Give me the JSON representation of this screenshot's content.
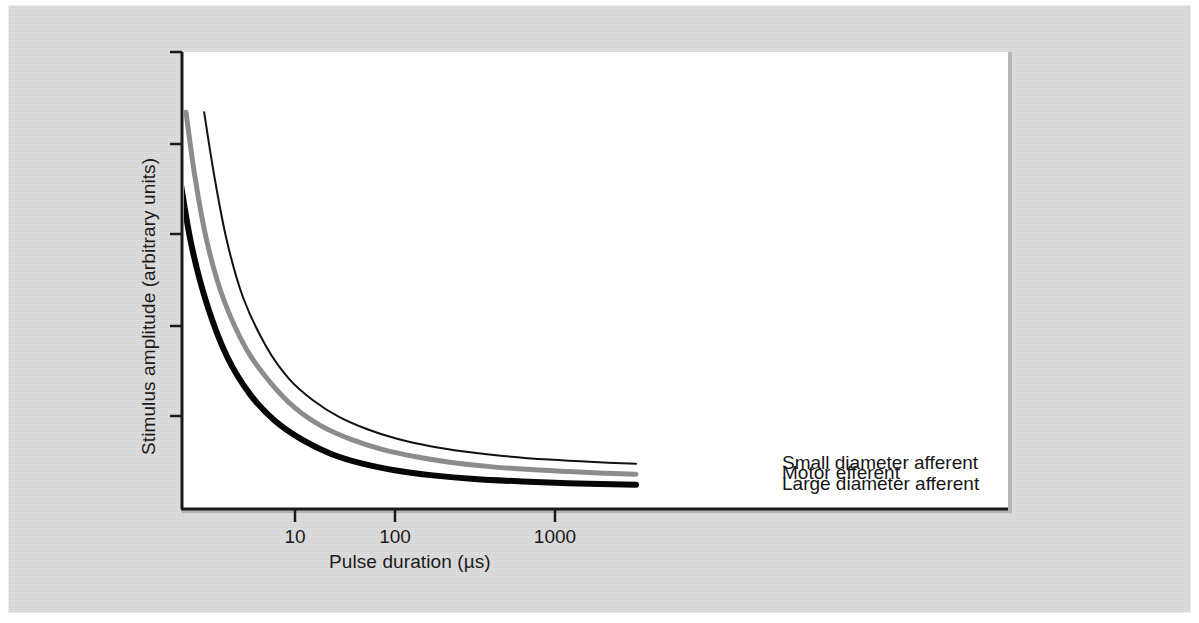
{
  "chart_data": {
    "type": "line",
    "title": "",
    "subtitle": "",
    "xlabel": "Pulse duration (µs)",
    "ylabel": "Stimulus amplitude (arbitrary units)",
    "xscale": "log",
    "yscale": "linear",
    "grid": false,
    "legend_position": "inline-right-of-curves",
    "xticks": [
      {
        "value": 10,
        "label": "10",
        "px": 295
      },
      {
        "value": 100,
        "label": "100",
        "px": 395
      },
      {
        "value": 1000,
        "label": "1000",
        "px": 555
      }
    ],
    "yticks": [
      {
        "label": "",
        "px": 52
      },
      {
        "label": "",
        "px": 144
      },
      {
        "label": "",
        "px": 234
      },
      {
        "label": "",
        "px": 326
      },
      {
        "label": "",
        "px": 416
      }
    ],
    "annotation": "Strength-duration curves: larger diameter fibres are recruited at lower stimulus amplitude for any given pulse duration.",
    "series": [
      {
        "name": "Small diameter afferent",
        "color": "#111111",
        "linewidth": 2,
        "style": "thin-black",
        "rheobase": 0.3,
        "chronaxie_us": 7.0,
        "points": [
          {
            "x": 2.0,
            "y": 0.96
          },
          {
            "x": 2.4,
            "y": 0.8
          },
          {
            "x": 3.0,
            "y": 0.64
          },
          {
            "x": 4.0,
            "y": 0.5
          },
          {
            "x": 6.0,
            "y": 0.38
          },
          {
            "x": 9.0,
            "y": 0.3
          },
          {
            "x": 14.0,
            "y": 0.245
          },
          {
            "x": 22.0,
            "y": 0.205
          },
          {
            "x": 36.0,
            "y": 0.175
          },
          {
            "x": 60.0,
            "y": 0.152
          },
          {
            "x": 110.0,
            "y": 0.133
          },
          {
            "x": 200.0,
            "y": 0.12
          },
          {
            "x": 400.0,
            "y": 0.109
          },
          {
            "x": 900.0,
            "y": 0.1
          },
          {
            "x": 2000.0,
            "y": 0.094
          },
          {
            "x": 4200.0,
            "y": 0.09
          }
        ]
      },
      {
        "name": "Motor efferent",
        "color": "#8c8c8c",
        "linewidth": 5,
        "style": "thick-gray",
        "rheobase": 0.22,
        "chronaxie_us": 4.5,
        "points": [
          {
            "x": 1.45,
            "y": 0.96
          },
          {
            "x": 1.7,
            "y": 0.8
          },
          {
            "x": 2.1,
            "y": 0.64
          },
          {
            "x": 2.8,
            "y": 0.5
          },
          {
            "x": 4.2,
            "y": 0.375
          },
          {
            "x": 6.5,
            "y": 0.29
          },
          {
            "x": 10.0,
            "y": 0.228
          },
          {
            "x": 16.0,
            "y": 0.183
          },
          {
            "x": 27.0,
            "y": 0.15
          },
          {
            "x": 46.0,
            "y": 0.126
          },
          {
            "x": 85.0,
            "y": 0.107
          },
          {
            "x": 160.0,
            "y": 0.093
          },
          {
            "x": 330.0,
            "y": 0.082
          },
          {
            "x": 750.0,
            "y": 0.074
          },
          {
            "x": 1800.0,
            "y": 0.068
          },
          {
            "x": 4200.0,
            "y": 0.064
          }
        ]
      },
      {
        "name": "Large diameter afferent",
        "color": "#070707",
        "linewidth": 6,
        "style": "thick-black",
        "rheobase": 0.13,
        "chronaxie_us": 3.0,
        "points": [
          {
            "x": 1.12,
            "y": 0.96
          },
          {
            "x": 1.3,
            "y": 0.8
          },
          {
            "x": 1.6,
            "y": 0.63
          },
          {
            "x": 2.1,
            "y": 0.485
          },
          {
            "x": 3.0,
            "y": 0.355
          },
          {
            "x": 4.5,
            "y": 0.262
          },
          {
            "x": 7.0,
            "y": 0.196
          },
          {
            "x": 11.5,
            "y": 0.148
          },
          {
            "x": 19.0,
            "y": 0.114
          },
          {
            "x": 33.0,
            "y": 0.09
          },
          {
            "x": 60.0,
            "y": 0.073
          },
          {
            "x": 115.0,
            "y": 0.061
          },
          {
            "x": 240.0,
            "y": 0.052
          },
          {
            "x": 560.0,
            "y": 0.046
          },
          {
            "x": 1500.0,
            "y": 0.041
          },
          {
            "x": 4200.0,
            "y": 0.038
          }
        ]
      }
    ]
  },
  "colors": {
    "page_background": "#d2d2d2",
    "panel_background": "#ffffff",
    "axis": "#1a1a1a",
    "text": "#1b1b1b",
    "small_afferent": "#111111",
    "motor_efferent": "#8c8c8c",
    "large_afferent": "#070707"
  }
}
